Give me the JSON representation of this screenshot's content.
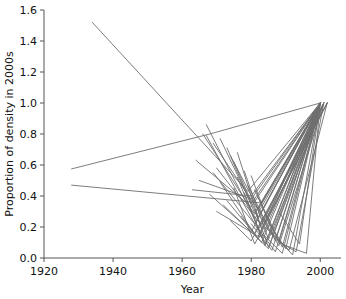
{
  "chart_data": {
    "type": "line",
    "title": "",
    "subtitle": "",
    "xlabel": "Year",
    "ylabel": "Proportion of density in 2000s",
    "xlim": [
      1920,
      2006
    ],
    "ylim": [
      0.0,
      1.6
    ],
    "xticks": [
      1920,
      1940,
      1960,
      1980,
      2000
    ],
    "xticklabels": [
      "1920",
      "1940",
      "1960",
      "1980",
      "2000"
    ],
    "yticks": [
      0.0,
      0.2,
      0.4,
      0.6,
      0.8,
      1.0,
      1.2,
      1.4,
      1.6
    ],
    "yticklabels": [
      "0.0",
      "0.2",
      "0.4",
      "0.6",
      "0.8",
      "1.0",
      "1.2",
      "1.4",
      "1.6"
    ],
    "grid": false,
    "legend": null,
    "line_color": "#6e6e6e",
    "series": [
      {
        "name": "site-01",
        "x": [
          1934,
          1979,
          2000
        ],
        "y": [
          1.52,
          0.43,
          1.0
        ]
      },
      {
        "name": "site-02",
        "x": [
          1928,
          1968,
          2000
        ],
        "y": [
          0.575,
          0.8,
          1.0
        ]
      },
      {
        "name": "site-03",
        "x": [
          1928,
          1983,
          2000
        ],
        "y": [
          0.47,
          0.355,
          1.0
        ]
      },
      {
        "name": "site-04",
        "x": [
          1966,
          1981,
          2000
        ],
        "y": [
          0.8,
          0.28,
          1.0
        ]
      },
      {
        "name": "site-05",
        "x": [
          1967,
          1982,
          2001
        ],
        "y": [
          0.79,
          0.18,
          1.0
        ]
      },
      {
        "name": "site-06",
        "x": [
          1964,
          1980,
          2000
        ],
        "y": [
          0.63,
          0.33,
          1.0
        ]
      },
      {
        "name": "site-07",
        "x": [
          1969,
          1981,
          2000
        ],
        "y": [
          0.55,
          0.22,
          1.0
        ]
      },
      {
        "name": "site-08",
        "x": [
          1971,
          1982,
          2001
        ],
        "y": [
          0.49,
          0.12,
          1.0
        ]
      },
      {
        "name": "site-09",
        "x": [
          1968,
          1980,
          2000
        ],
        "y": [
          0.41,
          0.17,
          1.0
        ]
      },
      {
        "name": "site-10",
        "x": [
          1973,
          1983,
          2000
        ],
        "y": [
          0.37,
          0.1,
          1.0
        ]
      },
      {
        "name": "site-11",
        "x": [
          1975,
          1981,
          2002
        ],
        "y": [
          0.45,
          0.09,
          1.0
        ]
      },
      {
        "name": "site-12",
        "x": [
          1970,
          1982,
          2000
        ],
        "y": [
          0.3,
          0.14,
          1.0
        ]
      },
      {
        "name": "site-13",
        "x": [
          1976,
          1984,
          2000
        ],
        "y": [
          0.52,
          0.08,
          1.0
        ]
      },
      {
        "name": "site-14",
        "x": [
          1974,
          1980,
          2001
        ],
        "y": [
          0.24,
          0.11,
          1.0
        ]
      },
      {
        "name": "site-15",
        "x": [
          1978,
          1983,
          2000
        ],
        "y": [
          0.42,
          0.13,
          1.0
        ]
      },
      {
        "name": "site-16",
        "x": [
          1972,
          1985,
          2000
        ],
        "y": [
          0.34,
          0.06,
          1.0
        ]
      },
      {
        "name": "site-17",
        "x": [
          1977,
          1981,
          2002
        ],
        "y": [
          0.27,
          0.16,
          1.0
        ]
      },
      {
        "name": "site-18",
        "x": [
          1979,
          1984,
          2000
        ],
        "y": [
          0.36,
          0.09,
          1.0
        ]
      },
      {
        "name": "site-19",
        "x": [
          1980,
          1986,
          2000
        ],
        "y": [
          0.22,
          0.05,
          1.0
        ]
      },
      {
        "name": "site-20",
        "x": [
          1981,
          1985,
          2001
        ],
        "y": [
          0.31,
          0.07,
          1.0
        ]
      },
      {
        "name": "site-21",
        "x": [
          1970,
          1983,
          2000
        ],
        "y": [
          0.58,
          0.21,
          1.0
        ]
      },
      {
        "name": "site-22",
        "x": [
          1975,
          1982,
          2000
        ],
        "y": [
          0.62,
          0.26,
          1.0
        ]
      },
      {
        "name": "site-23",
        "x": [
          1965,
          1980,
          2000
        ],
        "y": [
          0.5,
          0.38,
          1.0
        ]
      },
      {
        "name": "site-24",
        "x": [
          1982,
          1987,
          2000
        ],
        "y": [
          0.19,
          0.04,
          1.0
        ]
      },
      {
        "name": "site-25",
        "x": [
          1983,
          1988,
          2001
        ],
        "y": [
          0.26,
          0.08,
          1.0
        ]
      },
      {
        "name": "site-26",
        "x": [
          1979,
          1986,
          2000
        ],
        "y": [
          0.47,
          0.15,
          1.0
        ]
      },
      {
        "name": "site-27",
        "x": [
          1984,
          1989,
          2000
        ],
        "y": [
          0.14,
          0.03,
          1.0
        ]
      },
      {
        "name": "site-28",
        "x": [
          1976,
          1983,
          2002
        ],
        "y": [
          0.68,
          0.19,
          1.0
        ]
      },
      {
        "name": "site-29",
        "x": [
          1973,
          1981,
          2000
        ],
        "y": [
          0.71,
          0.29,
          1.0
        ]
      },
      {
        "name": "site-30",
        "x": [
          1985,
          1990,
          2000
        ],
        "y": [
          0.23,
          0.06,
          1.0
        ]
      },
      {
        "name": "site-31",
        "x": [
          1978,
          1985,
          2001
        ],
        "y": [
          0.56,
          0.12,
          1.0
        ]
      },
      {
        "name": "site-32",
        "x": [
          1981,
          1988,
          2000
        ],
        "y": [
          0.44,
          0.1,
          1.0
        ]
      },
      {
        "name": "site-33",
        "x": [
          1986,
          1992,
          2000
        ],
        "y": [
          0.16,
          0.02,
          1.0
        ]
      },
      {
        "name": "site-34",
        "x": [
          1974,
          1984,
          2000
        ],
        "y": [
          0.66,
          0.23,
          1.0
        ]
      },
      {
        "name": "site-35",
        "x": [
          1969,
          1982,
          2000
        ],
        "y": [
          0.74,
          0.31,
          1.0
        ]
      },
      {
        "name": "site-36",
        "x": [
          1987,
          1993,
          2001
        ],
        "y": [
          0.12,
          0.04,
          1.0
        ]
      },
      {
        "name": "site-37",
        "x": [
          1982,
          1989,
          2000
        ],
        "y": [
          0.39,
          0.07,
          1.0
        ]
      },
      {
        "name": "site-38",
        "x": [
          1971,
          1980,
          2000
        ],
        "y": [
          0.77,
          0.35,
          1.0
        ]
      },
      {
        "name": "site-39",
        "x": [
          1988,
          1994,
          2000
        ],
        "y": [
          0.3,
          0.09,
          1.0
        ]
      },
      {
        "name": "site-40",
        "x": [
          1967,
          1981,
          2000
        ],
        "y": [
          0.86,
          0.25,
          1.0
        ]
      },
      {
        "name": "site-41",
        "x": [
          1984,
          1991,
          2002
        ],
        "y": [
          0.2,
          0.05,
          1.0
        ]
      },
      {
        "name": "site-42",
        "x": [
          1980,
          1987,
          2000
        ],
        "y": [
          0.53,
          0.11,
          1.0
        ]
      },
      {
        "name": "site-43",
        "x": [
          1963,
          1980,
          2000
        ],
        "y": [
          0.44,
          0.4,
          1.0
        ]
      },
      {
        "name": "site-44",
        "x": [
          1990,
          1996,
          2000
        ],
        "y": [
          0.08,
          0.03,
          1.0
        ]
      }
    ]
  }
}
